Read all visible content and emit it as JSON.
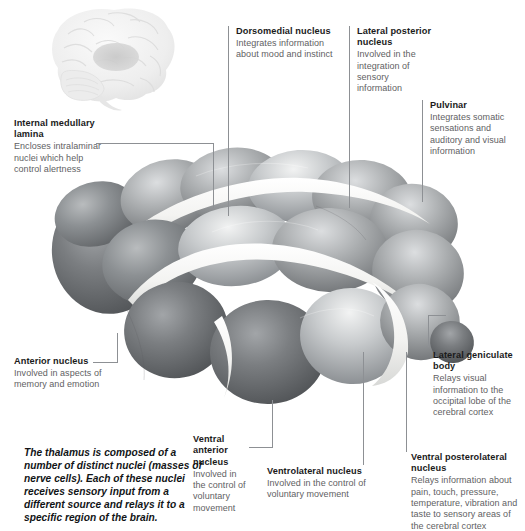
{
  "figure": {
    "subject": "thalamus",
    "brain_inset": {
      "name": "lateral-brain-view",
      "highlight_region": "thalamus"
    },
    "colors": {
      "background": "#ffffff",
      "heading_text": "#1b1b1b",
      "body_text": "#5f6163",
      "leader_line": "#8d9094",
      "caption_text": "#111416",
      "nucleus_dark": "#6f7275",
      "nucleus_mid": "#9a9da0",
      "nucleus_light": "#e9eaec",
      "lamina_white": "#f7f7f6"
    }
  },
  "caption": {
    "text": "The thalamus is composed of a number of distinct nuclei (masses of nerve cells). Each of these nuclei receives sensory input from a different source and relays it to a specific region of the brain."
  },
  "callouts": [
    {
      "id": "internal-medullary-lamina",
      "title": "Internal medullary lamina",
      "description": "Encloses intralaminar nuclei which help control alertness"
    },
    {
      "id": "dorsomedial-nucleus",
      "title": "Dorsomedial nucleus",
      "description": "Integrates information about mood and instinct"
    },
    {
      "id": "lateral-posterior-nucleus",
      "title": "Lateral posterior nucleus",
      "description": "Involved in the integration of sensory information"
    },
    {
      "id": "pulvinar",
      "title": "Pulvinar",
      "description": "Integrates somatic sensations and auditory and visual information"
    },
    {
      "id": "anterior-nucleus",
      "title": "Anterior nucleus",
      "description": "Involved in aspects of memory and emotion"
    },
    {
      "id": "lateral-geniculate-body",
      "title": "Lateral geniculate body",
      "description": "Relays visual information to the occipital lobe of the cerebral cortex"
    },
    {
      "id": "ventral-anterior-nucleus",
      "title": "Ventral anterior nucleus",
      "description": "Involved in the control of voluntary movement"
    },
    {
      "id": "ventrolateral-nucleus",
      "title": "Ventrolateral nucleus",
      "description": "Involved in the control of voluntary movement"
    },
    {
      "id": "ventral-posterolateral-nucleus",
      "title": "Ventral posterolateral nucleus",
      "description": "Relays information about pain, touch, pressure, temperature, vibration and taste to sensory areas of the cerebral cortex"
    }
  ]
}
